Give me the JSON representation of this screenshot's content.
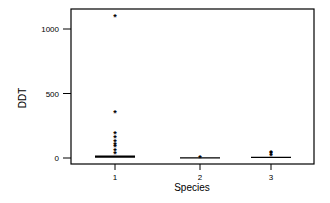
{
  "chart_data": {
    "type": "box",
    "title": "",
    "xlabel": "Species",
    "ylabel": "DDT",
    "categories": [
      "1",
      "2",
      "3"
    ],
    "yticks": [
      0,
      500,
      1000
    ],
    "ylim": [
      -50,
      1200
    ],
    "grid": false,
    "legend": null,
    "series": [
      {
        "name": "1",
        "median": 10,
        "q1": 5,
        "q3": 15,
        "outliers": [
          1100,
          360,
          190,
          160,
          130,
          110,
          90,
          60,
          40
        ]
      },
      {
        "name": "2",
        "median": 1,
        "q1": 0,
        "q3": 2,
        "outliers": [
          5
        ]
      },
      {
        "name": "3",
        "median": 5,
        "q1": 2,
        "q3": 8,
        "outliers": [
          45,
          35,
          25
        ]
      }
    ]
  }
}
